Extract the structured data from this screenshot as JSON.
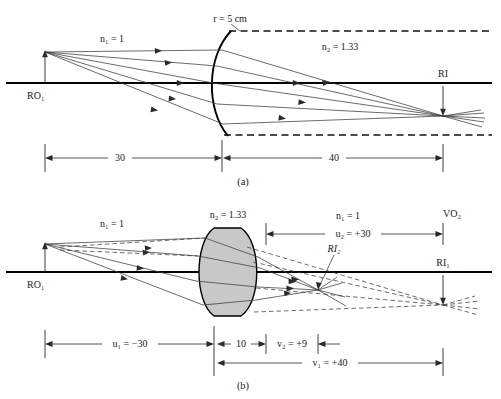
{
  "figure": {
    "panels": [
      {
        "id": "a",
        "caption": "(a)",
        "labels": {
          "n1": "n₁ = 1",
          "n2": "n₂ = 1.33",
          "radius": "r = 5 cm",
          "object": "RO₁",
          "image": "RI",
          "dim_object_distance": "30",
          "dim_image_distance": "40"
        },
        "values": {
          "n1": 1,
          "n2": 1.33,
          "radius_cm": 5,
          "object_distance": 30,
          "image_distance": 40
        }
      },
      {
        "id": "b",
        "caption": "(b)",
        "labels": {
          "n1_left": "n₁ = 1",
          "n2_lens": "n₂ = 1.33",
          "n1_right": "n₁ = 1",
          "virtual_object": "VO₂",
          "object": "RO₁",
          "real_image_2": "RI₂",
          "real_image_1": "RI₁",
          "dim_u1": "u₁ = −30",
          "dim_thickness": "10",
          "dim_v2": "v₂ = +9",
          "dim_u2": "u₂ = +30",
          "dim_v1": "v₁ = +40"
        },
        "values": {
          "n1": 1,
          "n2": 1.33,
          "u1": -30,
          "thickness": 10,
          "v2": 9,
          "u2": 30,
          "v1": 40
        }
      }
    ]
  },
  "colors": {
    "ink": "#1a1a1a",
    "axis": "#000000",
    "ray": "#3a3a3a",
    "lens_fill": "#c8c8c8",
    "background": "#ffffff"
  }
}
